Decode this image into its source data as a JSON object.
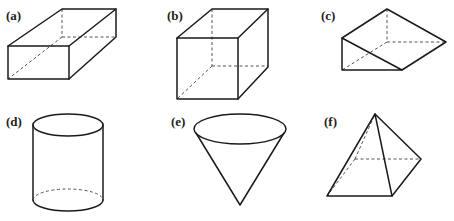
{
  "figure": {
    "panels": [
      {
        "id": "a",
        "label": "(a)",
        "shape": "rectangular-prism"
      },
      {
        "id": "b",
        "label": "(b)",
        "shape": "cube"
      },
      {
        "id": "c",
        "label": "(c)",
        "shape": "triangular-prism"
      },
      {
        "id": "d",
        "label": "(d)",
        "shape": "cylinder"
      },
      {
        "id": "e",
        "label": "(e)",
        "shape": "cone"
      },
      {
        "id": "f",
        "label": "(f)",
        "shape": "square-pyramid"
      }
    ],
    "colors": {
      "edge": "#1a1a1a",
      "hidden_edge": "#555555",
      "background": "#ffffff"
    }
  }
}
